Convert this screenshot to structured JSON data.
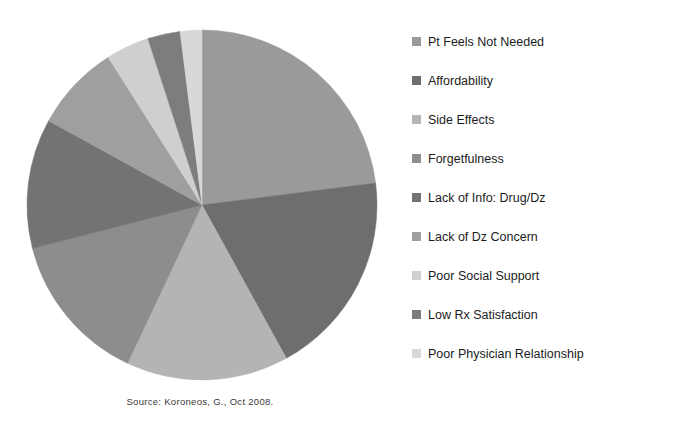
{
  "source_note": "Source: Koroneos, G., Oct 2008.",
  "legend": {
    "items": [
      {
        "label": "Pt Feels Not Needed",
        "color": "#9a9a9a",
        "swatch_icon": "legend-swatch-icon"
      },
      {
        "label": "Affordability",
        "color": "#6e6e6e",
        "swatch_icon": "legend-swatch-icon"
      },
      {
        "label": "Side Effects",
        "color": "#b4b4b4",
        "swatch_icon": "legend-swatch-icon"
      },
      {
        "label": "Forgetfulness",
        "color": "#8d8d8d",
        "swatch_icon": "legend-swatch-icon"
      },
      {
        "label": "Lack of Info: Drug/Dz",
        "color": "#737373",
        "swatch_icon": "legend-swatch-icon"
      },
      {
        "label": "Lack of Dz Concern",
        "color": "#9f9f9f",
        "swatch_icon": "legend-swatch-icon"
      },
      {
        "label": "Poor Social Support",
        "color": "#cfcfcf",
        "swatch_icon": "legend-swatch-icon"
      },
      {
        "label": "Low Rx Satisfaction",
        "color": "#7d7d7d",
        "swatch_icon": "legend-swatch-icon"
      },
      {
        "label": "Poor Physician Relationship",
        "color": "#d8d8d8",
        "swatch_icon": "legend-swatch-icon"
      }
    ]
  },
  "chart_data": {
    "type": "pie",
    "title": "",
    "subtitle": "",
    "xlabel": "",
    "ylabel": "",
    "legend_position": "right",
    "grid": false,
    "start_angle_deg": 0,
    "direction": "clockwise",
    "center": {
      "x": 202,
      "y": 205
    },
    "radius": 175,
    "categories": [
      "Pt Feels Not Needed",
      "Affordability",
      "Side Effects",
      "Forgetfulness",
      "Lack of Info: Drug/Dz",
      "Lack of Dz Concern",
      "Poor Social Support",
      "Low Rx Satisfaction",
      "Poor Physician Relationship"
    ],
    "values": [
      23,
      19,
      15,
      14,
      12,
      8,
      4,
      3,
      2
    ],
    "colors": [
      "#9a9a9a",
      "#6e6e6e",
      "#b4b4b4",
      "#8d8d8d",
      "#737373",
      "#9f9f9f",
      "#cfcfcf",
      "#7d7d7d",
      "#d8d8d8"
    ],
    "annotations": [
      "Source: Koroneos, G., Oct 2008."
    ]
  }
}
